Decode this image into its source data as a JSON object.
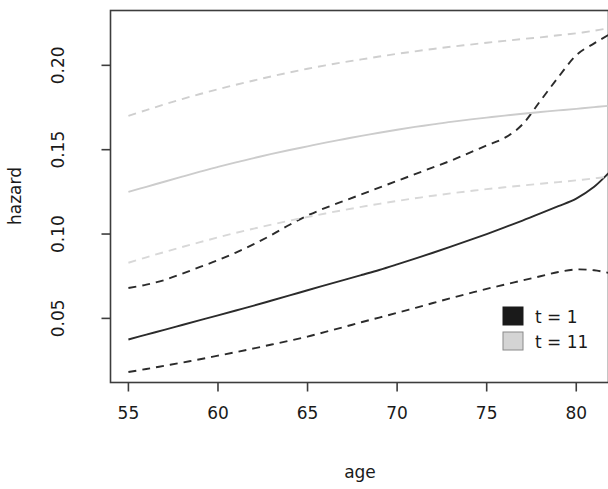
{
  "chart_data": {
    "type": "line",
    "title": "",
    "xlabel": "age",
    "ylabel": "hazard",
    "xlim": [
      54.0,
      81.8
    ],
    "ylim": [
      0.012,
      0.2325
    ],
    "xticks": [
      55,
      60,
      65,
      70,
      75,
      80
    ],
    "xtick_labels": [
      "55",
      "60",
      "65",
      "70",
      "75",
      "80"
    ],
    "yticks": [
      0.05,
      0.1,
      0.15,
      0.2
    ],
    "ytick_labels": [
      "0.05",
      "0.10",
      "0.15",
      "0.20"
    ],
    "grid": false,
    "legend_position": "bottom-right",
    "legend": [
      {
        "label": "t = 1",
        "color": "#1a1a1a",
        "swatch": "filled-square"
      },
      {
        "label": "t = 11",
        "color": "#d4d4d4",
        "swatch": "filled-square"
      }
    ],
    "x": [
      55,
      56,
      57,
      58,
      59,
      60,
      61,
      62,
      63,
      64,
      65,
      66,
      67,
      68,
      69,
      70,
      71,
      72,
      73,
      74,
      75,
      76,
      77,
      78,
      79,
      80,
      81,
      81.8
    ],
    "series": [
      {
        "name": "t = 1 fit",
        "group": "t = 1",
        "style": "solid",
        "color": "#2b2b2b",
        "values": [
          0.0375,
          0.0404,
          0.0432,
          0.0461,
          0.049,
          0.0518,
          0.0547,
          0.0576,
          0.0606,
          0.0636,
          0.0667,
          0.0697,
          0.0727,
          0.0757,
          0.0787,
          0.082,
          0.0854,
          0.0889,
          0.0925,
          0.0962,
          0.1,
          0.104,
          0.108,
          0.1122,
          0.1165,
          0.121,
          0.128,
          0.136
        ]
      },
      {
        "name": "t = 1 upper CI",
        "group": "t = 1",
        "style": "dashed",
        "color": "#2b2b2b",
        "values": [
          0.068,
          0.07,
          0.0727,
          0.0765,
          0.0805,
          0.0845,
          0.089,
          0.094,
          0.0995,
          0.1055,
          0.111,
          0.1155,
          0.1195,
          0.1235,
          0.1275,
          0.1315,
          0.1355,
          0.1395,
          0.1435,
          0.148,
          0.1525,
          0.157,
          0.165,
          0.179,
          0.193,
          0.206,
          0.213,
          0.218
        ]
      },
      {
        "name": "t = 1 lower CI",
        "group": "t = 1",
        "style": "dashed",
        "color": "#2b2b2b",
        "values": [
          0.0182,
          0.02,
          0.0219,
          0.0238,
          0.0258,
          0.0279,
          0.03,
          0.0322,
          0.0345,
          0.0368,
          0.0392,
          0.042,
          0.0448,
          0.0477,
          0.0505,
          0.0533,
          0.0562,
          0.0591,
          0.062,
          0.0648,
          0.0675,
          0.07,
          0.0725,
          0.075,
          0.0775,
          0.079,
          0.0785,
          0.077
        ]
      },
      {
        "name": "t = 11 fit",
        "group": "t = 11",
        "style": "solid",
        "color": "#cccccc",
        "values": [
          0.125,
          0.128,
          0.131,
          0.134,
          0.137,
          0.1398,
          0.1425,
          0.145,
          0.1475,
          0.1498,
          0.152,
          0.1542,
          0.1562,
          0.1582,
          0.16,
          0.1618,
          0.1635,
          0.165,
          0.1665,
          0.1678,
          0.169,
          0.1702,
          0.1713,
          0.1723,
          0.1733,
          0.1742,
          0.1752,
          0.176
        ]
      },
      {
        "name": "t = 11 upper CI",
        "group": "t = 11",
        "style": "dashed",
        "color": "#cfcfcf",
        "values": [
          0.17,
          0.1735,
          0.1768,
          0.18,
          0.183,
          0.1858,
          0.1885,
          0.191,
          0.1935,
          0.1958,
          0.198,
          0.2,
          0.2018,
          0.2035,
          0.2052,
          0.2068,
          0.2083,
          0.2097,
          0.211,
          0.2122,
          0.2134,
          0.2145,
          0.2156,
          0.2166,
          0.2178,
          0.219,
          0.2205,
          0.222
        ]
      },
      {
        "name": "t = 11 lower CI",
        "group": "t = 11",
        "style": "dashed",
        "color": "#d8d8d8",
        "values": [
          0.083,
          0.0862,
          0.0893,
          0.0923,
          0.0952,
          0.098,
          0.1007,
          0.1032,
          0.1056,
          0.1079,
          0.1101,
          0.1122,
          0.1142,
          0.1161,
          0.1179,
          0.1196,
          0.1212,
          0.1227,
          0.1241,
          0.1254,
          0.1266,
          0.1277,
          0.1288,
          0.1298,
          0.1308,
          0.1318,
          0.133,
          0.134
        ]
      }
    ]
  },
  "figure": {
    "background": "#ffffff",
    "frame_color": "#3d3d3d"
  }
}
